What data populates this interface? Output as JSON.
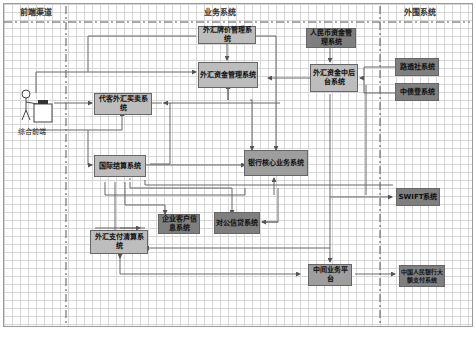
{
  "lanes": {
    "front": "前端渠道",
    "business": "业务系统",
    "external": "外围系统"
  },
  "actor": {
    "label": "综合前端",
    "icon": "person-at-desk-icon"
  },
  "systems": {
    "fx_rate": "外汇牌价管理系统",
    "fx_fund": "外汇资金管理系统",
    "rmb_fund": "人民币资金管理系统",
    "fx_backoffice": "外汇资金中后台系统",
    "reuters": "路透社系统",
    "ccdc": "中债登系统",
    "fx_trading": "代客外汇买卖系统",
    "intl_settlement": "国际结算系统",
    "core_banking": "银行核心业务系统",
    "swift": "SWIFT系统",
    "corp_customer": "企业客户信息系统",
    "corp_credit": "对公信贷系统",
    "fx_payment": "外汇支付清算系统",
    "middle_platform": "中间业务平台",
    "pboc_hvps": "中国人民银行大额支付系统"
  },
  "colors": {
    "light_box": "#bdbdbd",
    "mid_box": "#9e9e9e",
    "dark_box": "#7f7f7f",
    "grid": "#d6d6d6",
    "line": "#555555"
  }
}
